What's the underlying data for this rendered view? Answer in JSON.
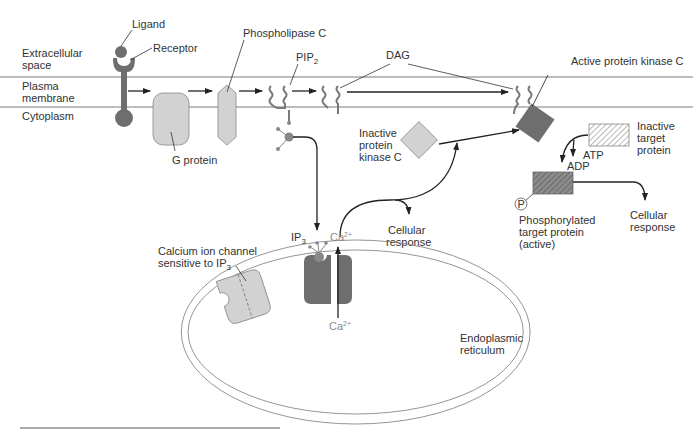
{
  "regions": {
    "extracellular": [
      "Extracellular",
      "space"
    ],
    "membrane": [
      "Plasma",
      "membrane"
    ],
    "cytoplasm": "Cytoplasm"
  },
  "labels": {
    "ligand": "Ligand",
    "receptor": "Receptor",
    "g_protein": "G protein",
    "phospholipase_c": "Phospholipase C",
    "pip2": "PIP",
    "pip2_sub": "2",
    "dag": "DAG",
    "active_pkc": "Active protein kinase C",
    "inactive_pkc": [
      "Inactive",
      "protein",
      "kinase C"
    ],
    "inactive_target": [
      "Inactive",
      "target",
      "protein"
    ],
    "atp": "ATP",
    "adp": "ADP",
    "phosphate": "P",
    "phosphorylated_target": [
      "Phosphorylated",
      "target protein",
      "(active)"
    ],
    "cellular_response_1": [
      "Cellular",
      "response"
    ],
    "cellular_response_2": [
      "Cellular",
      "response"
    ],
    "ip3": "IP",
    "ip3_sub": "3",
    "ca_top": "Ca",
    "ca_top_sup": "2+",
    "ca_bottom": "Ca",
    "ca_bottom_sup": "2+",
    "calcium_channel": [
      "Calcium ion channel",
      "sensitive to IP"
    ],
    "calcium_channel_sub": "3",
    "er": [
      "Endoplasmic",
      "reticulum"
    ]
  },
  "colors": {
    "dark_protein": "#6e6e6e",
    "light_protein": "#d2d2d2",
    "membrane_line": "#7a7a7a"
  }
}
